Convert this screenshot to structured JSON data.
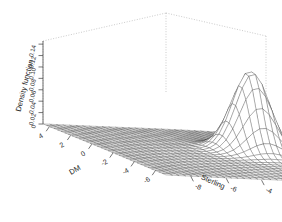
{
  "chart_data": {
    "type": "surface",
    "title": "",
    "subtitle": "",
    "render_style": "wireframe-perspective",
    "xlabel": "DM",
    "ylabel": "Sterling",
    "zlabel": "Density function",
    "x_ticks": [
      "4",
      "2",
      "0",
      "-2",
      "-4",
      "-6"
    ],
    "x_tick_values": [
      4,
      2,
      0,
      -2,
      -4,
      -6
    ],
    "y_ticks": [
      "-8",
      "-6",
      "-4",
      "-2",
      "0",
      "2"
    ],
    "y_tick_values": [
      -8,
      -6,
      -4,
      -2,
      0,
      2
    ],
    "z_ticks": [
      "0.14",
      "0.12",
      "0.10",
      "0.08",
      "0.06",
      "0.04",
      "0.02",
      "0"
    ],
    "z_tick_values": [
      0.14,
      0.12,
      0.1,
      0.08,
      0.06,
      0.04,
      0.02,
      0
    ],
    "xlim": [
      -7,
      5
    ],
    "ylim": [
      -9,
      3
    ],
    "zlim": [
      0,
      0.145
    ],
    "grid": false,
    "legend": "none",
    "peak": {
      "x": -1.0,
      "y": -1.0,
      "z": 0.14,
      "description": "single sharp unimodal bivariate density peak"
    },
    "baseline_level": 0.0,
    "mesh_rows": 34,
    "mesh_cols": 34
  },
  "axes": {
    "z": {
      "title": "Density function",
      "ticks": [
        "0.14",
        "0.12",
        "0.10",
        "0.08",
        "0.06",
        "0.04",
        "0.02",
        "0"
      ]
    },
    "x": {
      "title": "DM",
      "ticks": [
        "4",
        "2",
        "0",
        "-2",
        "-4",
        "-6"
      ]
    },
    "y": {
      "title": "Sterling",
      "ticks": [
        "-8",
        "-6",
        "-4",
        "-2",
        "0",
        "2"
      ]
    }
  },
  "colors": {
    "background": "#ffffff",
    "mesh": "#333333",
    "axis": "#4a4a4a",
    "box_dotted": "#b4b4b4",
    "text": "#2b2b2b"
  }
}
